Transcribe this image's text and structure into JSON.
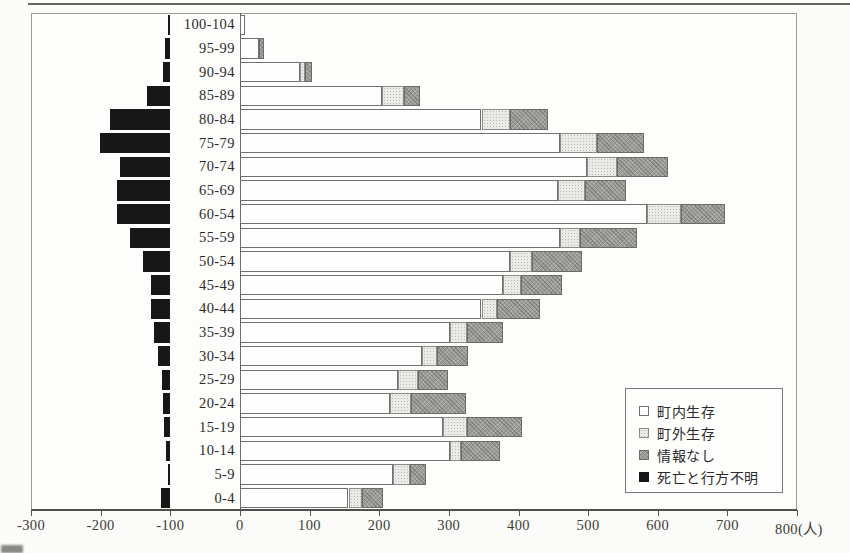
{
  "chart_data": {
    "type": "bar",
    "variant": "horizontal-stacked-population-pyramid",
    "categories": [
      "100-104",
      "95-99",
      "90-94",
      "85-89",
      "80-84",
      "75-79",
      "70-74",
      "65-69",
      "60-54",
      "55-59",
      "50-54",
      "45-49",
      "40-44",
      "35-39",
      "30-34",
      "25-29",
      "20-24",
      "15-19",
      "10-14",
      "5-9",
      "0-4"
    ],
    "series": [
      {
        "name": "町内生存",
        "key": "in-town-survivor",
        "direction": "right",
        "values": [
          8,
          27,
          86,
          204,
          347,
          460,
          498,
          457,
          584,
          460,
          388,
          378,
          347,
          302,
          261,
          227,
          215,
          292,
          302,
          220,
          156
        ]
      },
      {
        "name": "町外生存",
        "key": "out-of-town-survivor",
        "direction": "right",
        "values": [
          0,
          0,
          7,
          31,
          41,
          53,
          43,
          38,
          50,
          29,
          31,
          26,
          22,
          24,
          22,
          29,
          31,
          34,
          16,
          24,
          19
        ]
      },
      {
        "name": "情報なし",
        "key": "no-information",
        "direction": "right",
        "values": [
          0,
          7,
          11,
          24,
          55,
          67,
          74,
          60,
          62,
          81,
          72,
          58,
          62,
          52,
          45,
          43,
          79,
          79,
          56,
          24,
          31
        ]
      },
      {
        "name": "死亡と行方不明",
        "key": "dead-or-missing",
        "direction": "left",
        "base_offset": -100,
        "values": [
          3,
          8,
          11,
          34,
          87,
          101,
          72,
          76,
          76,
          58,
          39,
          28,
          28,
          23,
          18,
          12,
          10,
          9,
          6,
          3,
          14
        ]
      }
    ],
    "xlim": [
      -300,
      800
    ],
    "x_ticks": [
      -300,
      -200,
      -100,
      0,
      100,
      200,
      300,
      400,
      500,
      600,
      700,
      800
    ],
    "x_unit_suffix": "(人)",
    "grid": false,
    "legend_position": "inside-lower-right"
  },
  "colors": {
    "in_town": "#fefefe",
    "out_of_town": "#eaeae6",
    "no_info": "#9d9d99",
    "dead_missing": "#171717",
    "frame": "#9b9b97",
    "axis": "#4e4e4a"
  }
}
